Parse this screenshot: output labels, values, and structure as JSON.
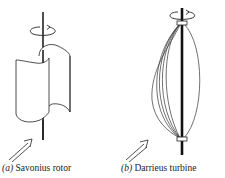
{
  "figure": {
    "panels": [
      {
        "id": "a",
        "label_prefix": "(a)",
        "label_text": "Savonius rotor",
        "parts": [
          "shaft",
          "rotation-arrow",
          "left-half-cylinder-bucket",
          "right-half-cylinder-bucket",
          "wind-direction-arrow"
        ]
      },
      {
        "id": "b",
        "label_prefix": "(b)",
        "label_text": "Darrieus turbine",
        "parts": [
          "shaft",
          "rotation-arrow",
          "top-hub-collar",
          "bottom-hub-collar",
          "curved-blades",
          "wind-direction-arrow"
        ]
      }
    ],
    "colors": {
      "line": "#222222",
      "background": "#ffffff"
    }
  }
}
